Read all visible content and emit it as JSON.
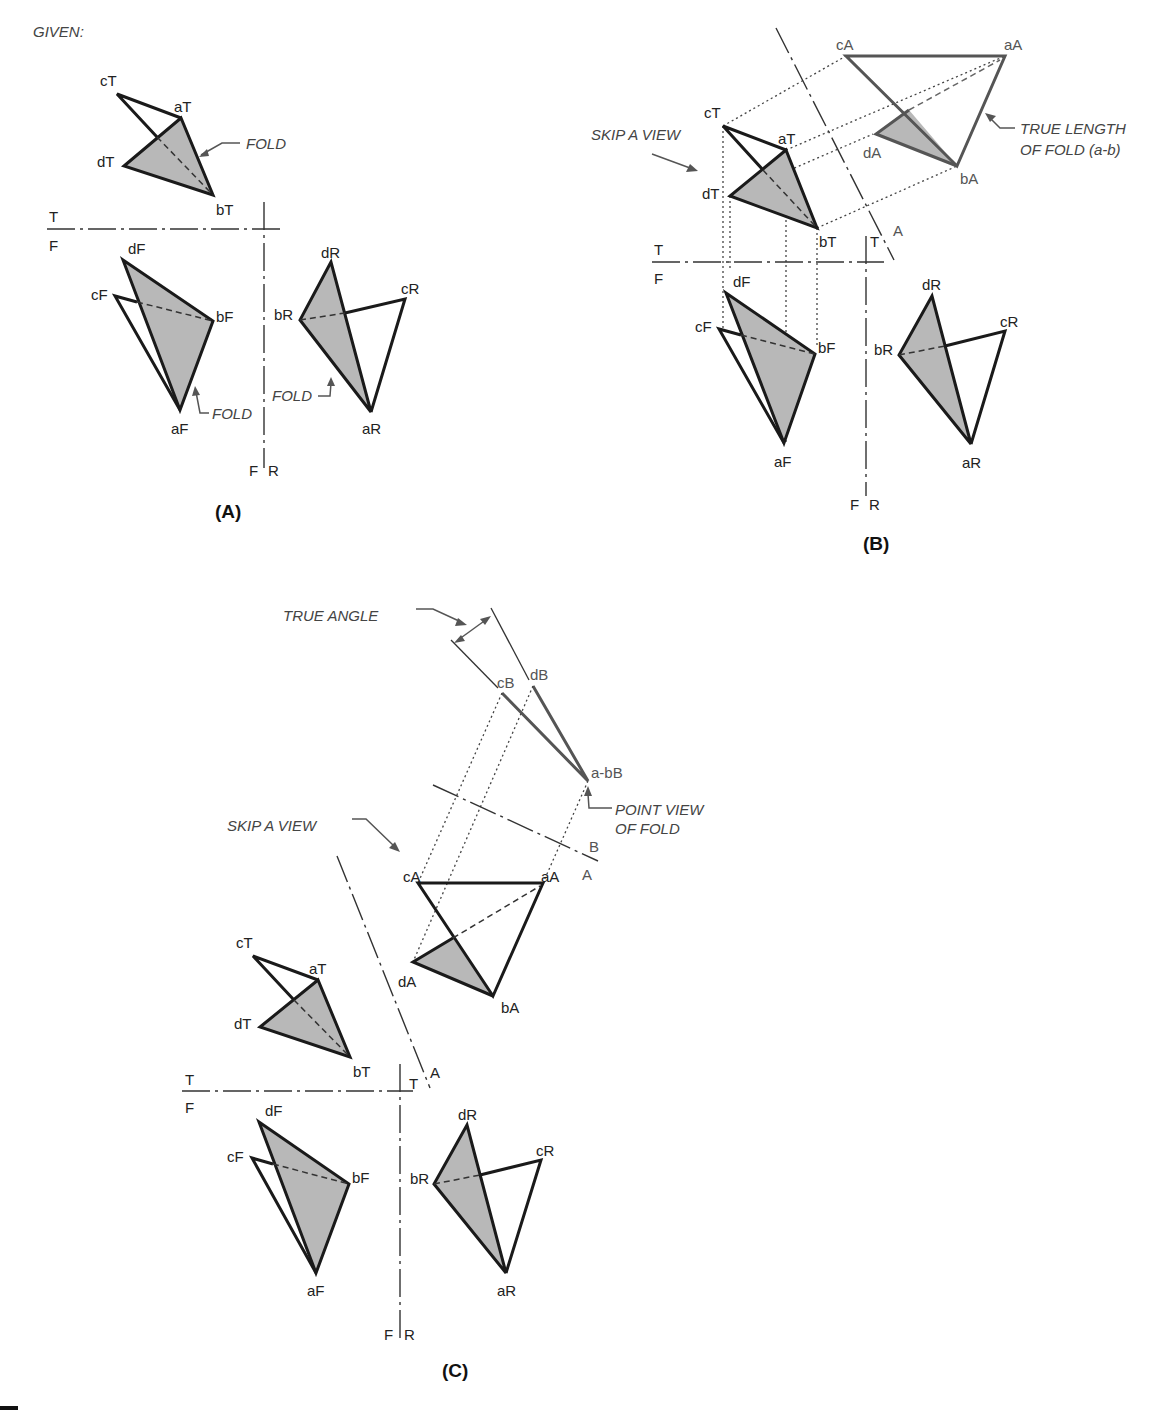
{
  "given_label": "GIVEN:",
  "captions": {
    "a": "(A)",
    "b": "(B)",
    "c": "(C)"
  },
  "notes": {
    "fold": "FOLD",
    "skip_a_view": "SKIP A VIEW",
    "true_length_1": "TRUE LENGTH",
    "true_length_2": "OF FOLD (a-b)",
    "true_angle": "TRUE ANGLE",
    "point_view_1": "POINT VIEW",
    "point_view_2": "OF FOLD"
  },
  "fold_line_labels": {
    "T": "T",
    "F": "F",
    "R": "R",
    "A": "A",
    "B": "B"
  },
  "points": {
    "top": {
      "a": "aT",
      "b": "bT",
      "c": "cT",
      "d": "dT"
    },
    "front": {
      "a": "aF",
      "b": "bF",
      "c": "cF",
      "d": "dF"
    },
    "right": {
      "a": "aR",
      "b": "bR",
      "c": "cR",
      "d": "dR"
    },
    "aux_a": {
      "a": "aA",
      "b": "bA",
      "c": "cA",
      "d": "dA"
    },
    "aux_b": {
      "ab": "a-bB",
      "c": "cB",
      "d": "dB"
    }
  },
  "colors": {
    "line": "#1a1a1a",
    "shade": "#b8b8b8",
    "annotation": "#444444"
  }
}
